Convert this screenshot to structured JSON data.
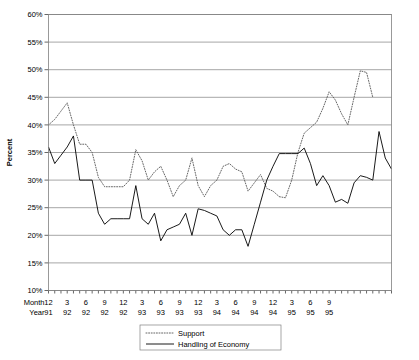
{
  "chart_data": {
    "type": "line",
    "title": "",
    "xlabel": "",
    "ylabel": "Percent",
    "ylim": [
      10,
      60
    ],
    "ytick_step": 5,
    "grid": true,
    "legend_position": "bottom-center",
    "x_row_labels": [
      "Month",
      "Year"
    ],
    "x_axis_major_ticks": [
      {
        "month": "12",
        "year": "91",
        "index": 0
      },
      {
        "month": "3",
        "year": "92",
        "index": 3
      },
      {
        "month": "6",
        "year": "92",
        "index": 6
      },
      {
        "month": "9",
        "year": "92",
        "index": 9
      },
      {
        "month": "12",
        "year": "92",
        "index": 12
      },
      {
        "month": "3",
        "year": "93",
        "index": 15
      },
      {
        "month": "6",
        "year": "93",
        "index": 18
      },
      {
        "month": "9",
        "year": "93",
        "index": 21
      },
      {
        "month": "12",
        "year": "93",
        "index": 24
      },
      {
        "month": "3",
        "year": "94",
        "index": 27
      },
      {
        "month": "6",
        "year": "94",
        "index": 30
      },
      {
        "month": "9",
        "year": "94",
        "index": 33
      },
      {
        "month": "12",
        "year": "94",
        "index": 36
      },
      {
        "month": "3",
        "year": "95",
        "index": 39
      },
      {
        "month": "6",
        "year": "95",
        "index": 42
      },
      {
        "month": "9",
        "year": "95",
        "index": 45
      }
    ],
    "ytick_labels": [
      "60%",
      "55%",
      "50%",
      "45%",
      "40%",
      "35%",
      "30%",
      "25%",
      "20%",
      "15%",
      "10%"
    ],
    "ytick_values": [
      60,
      55,
      50,
      45,
      40,
      35,
      30,
      25,
      20,
      15,
      10
    ],
    "n_points": 48,
    "series": [
      {
        "name": "Support",
        "style": "dotted",
        "color": "#555555",
        "values": [
          40,
          41,
          42.5,
          44,
          40,
          36.5,
          36.5,
          35,
          30.5,
          28.8,
          28.8,
          28.8,
          28.8,
          30,
          35.5,
          33.5,
          30,
          31.5,
          32.5,
          30,
          27,
          29,
          30,
          34,
          29,
          27,
          29,
          30,
          32.5,
          33,
          32,
          31.5,
          28,
          29.5,
          31,
          28.5,
          28,
          27,
          26.8,
          30,
          35,
          38.5,
          39.5,
          40.5,
          43,
          46,
          44.5,
          42
        ]
      },
      {
        "name": "Handling of Economy",
        "style": "solid",
        "color": "#000000",
        "values": [
          36,
          33,
          34.5,
          36,
          38,
          30,
          30,
          30,
          24,
          22,
          23,
          23,
          23,
          23,
          29,
          23,
          22,
          24,
          19,
          21,
          21.5,
          22,
          24,
          20,
          24.8,
          24.5,
          24,
          23.5,
          21,
          20,
          21,
          21,
          18,
          22,
          26,
          30,
          32.5,
          34.8,
          34.8,
          34.8,
          34.8,
          35.8,
          33,
          29,
          30.8,
          29,
          26,
          26.5
        ]
      }
    ],
    "series_tail": {
      "support": [
        40,
        45,
        49.8,
        49.5,
        45
      ],
      "handling": [
        25.8,
        29.5,
        30.8,
        30.5,
        30,
        38.8,
        34,
        32
      ]
    }
  },
  "legend": {
    "entries": [
      {
        "label": "Support",
        "style": "dotted"
      },
      {
        "label": "Handling of Economy",
        "style": "solid"
      }
    ]
  }
}
